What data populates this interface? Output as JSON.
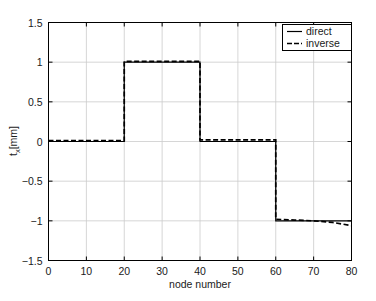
{
  "chart_data": {
    "type": "line",
    "title": "",
    "xlabel": "node number",
    "ylabel": "t_x[mm]",
    "ylabel_base": "t",
    "ylabel_sub": "x",
    "ylabel_unit": "[mm]",
    "xlim": [
      0,
      80
    ],
    "ylim": [
      -1.5,
      1.5
    ],
    "xticks": [
      0,
      10,
      20,
      30,
      40,
      50,
      60,
      70,
      80
    ],
    "xticklabels": [
      "0",
      "10",
      "20",
      "30",
      "40",
      "50",
      "60",
      "70",
      "80"
    ],
    "yticks": [
      -1.5,
      -1,
      -0.5,
      0,
      0.5,
      1,
      1.5
    ],
    "yticklabels": [
      "-1.5",
      "-1",
      "-0.5",
      "0",
      "0.5",
      "1",
      "1.5"
    ],
    "grid": true,
    "grid_color": "#cccccc",
    "axes_color": "#000000",
    "legend_position": "top-right",
    "series": [
      {
        "name": "direct",
        "style": "solid",
        "color": "#000000",
        "x": [
          0,
          5,
          10,
          15,
          20,
          20,
          25,
          30,
          35,
          40,
          40,
          45,
          50,
          55,
          60,
          60,
          65,
          70,
          75,
          80
        ],
        "values": [
          0,
          0,
          0,
          0,
          0,
          1,
          1,
          1,
          1,
          1,
          0,
          0,
          0,
          0,
          0,
          -1,
          -1,
          -1,
          -1,
          -1
        ]
      },
      {
        "name": "inverse",
        "style": "dashed",
        "color": "#000000",
        "x": [
          0,
          5,
          10,
          15,
          20,
          20,
          25,
          30,
          35,
          40,
          40,
          45,
          50,
          55,
          60,
          60,
          65,
          70,
          75,
          80
        ],
        "values": [
          0.01,
          0.01,
          0.01,
          0.01,
          0.01,
          1.01,
          1.01,
          1.01,
          1.01,
          1.01,
          0.02,
          0.02,
          0.02,
          0.02,
          0.02,
          -0.98,
          -0.99,
          -1.0,
          -1.02,
          -1.06
        ]
      }
    ]
  },
  "legend": {
    "items": [
      {
        "label": "direct",
        "style": "solid"
      },
      {
        "label": "inverse",
        "style": "dashed"
      }
    ]
  }
}
